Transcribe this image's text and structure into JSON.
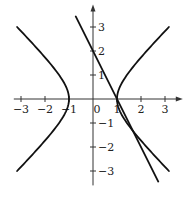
{
  "chart_data": {
    "type": "line",
    "title": "",
    "xlabel": "",
    "ylabel": "",
    "xlim": [
      -3.3,
      3.7
    ],
    "ylim": [
      -3.6,
      3.9
    ],
    "grid": false,
    "legend": null,
    "x_ticks": [
      -3,
      -2,
      -1,
      0,
      1,
      2,
      3
    ],
    "x_tick_labels": [
      "−3",
      "−2",
      "−1",
      "0",
      "1",
      "2",
      "3"
    ],
    "y_ticks": [
      -3,
      -2,
      -1,
      1,
      2,
      3
    ],
    "y_tick_labels": [
      "−3",
      "−2",
      "−1",
      "1",
      "2",
      "3"
    ],
    "series": [
      {
        "name": "hyperbola right branch (x² − y² = 1)",
        "kind": "hyperbola",
        "branch": 1,
        "y_range": [
          -3,
          3
        ]
      },
      {
        "name": "hyperbola left branch (x² − y² = 1)",
        "kind": "hyperbola",
        "branch": -1,
        "y_range": [
          -3,
          3
        ]
      },
      {
        "name": "line y = −2x + 2",
        "kind": "line",
        "slope": -2,
        "intercept": 2,
        "x_range": [
          -0.72,
          2.72
        ]
      }
    ],
    "intersections": [
      {
        "x": 1,
        "y": 0
      },
      {
        "x": 1.67,
        "y": -1.33
      }
    ]
  },
  "style": {
    "curve_color": "#111111",
    "axis_color": "#333333"
  }
}
